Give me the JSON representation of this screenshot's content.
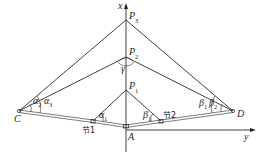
{
  "diagram": {
    "axes": {
      "x_label": "x",
      "y_label": "y"
    },
    "points": {
      "P3": {
        "label": "P",
        "sub": "3"
      },
      "P2": {
        "label": "P",
        "sub": "2"
      },
      "P1": {
        "label": "P",
        "sub": "1"
      },
      "A": {
        "label": "A"
      },
      "C": {
        "label": "C"
      },
      "D": {
        "label": "D"
      }
    },
    "nodes": {
      "node1": "节1",
      "node2": "节2"
    },
    "angles": {
      "gamma": "γ",
      "alpha1": {
        "label": "α",
        "sub": "1"
      },
      "alpha2": {
        "label": "α",
        "sub": "2"
      },
      "alpha3": {
        "label": "α",
        "sub": "3"
      },
      "beta1": {
        "label": "β",
        "sub": "1"
      },
      "beta1_D": {
        "label": "β",
        "sub": "1"
      },
      "beta2": {
        "label": "β",
        "sub": "2"
      }
    }
  }
}
